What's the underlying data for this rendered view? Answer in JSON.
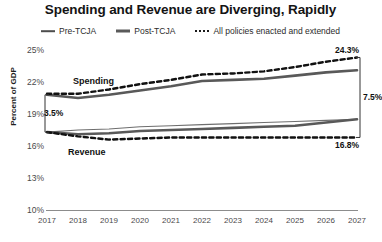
{
  "chart_data": {
    "type": "line",
    "title": "Spending and Revenue are Diverging, Rapidly",
    "xlabel": "",
    "ylabel": "Percent of GDP",
    "x": [
      2017,
      2018,
      2019,
      2020,
      2021,
      2022,
      2023,
      2024,
      2025,
      2026,
      2027
    ],
    "xtick_labels": [
      "2017",
      "2018",
      "2019",
      "2020",
      "2021",
      "2022",
      "2023",
      "2024",
      "2025",
      "2026",
      "2027"
    ],
    "ytick_labels": [
      "25%",
      "22%",
      "19%",
      "16%",
      "13%",
      "10%"
    ],
    "ytick_values": [
      25,
      22,
      19,
      16,
      13,
      10
    ],
    "ylim": [
      10,
      25
    ],
    "xlim": [
      2017,
      2027
    ],
    "grid": false,
    "legend_position": "top-center",
    "series": [
      {
        "name": "Pre-TCJA",
        "style": "solid-thin",
        "color": "#6e6e6e",
        "groups": [
          "spending",
          "revenue"
        ],
        "spending_values": [
          20.8,
          20.5,
          20.8,
          21.2,
          21.6,
          22.1,
          22.2,
          22.3,
          22.6,
          22.9,
          23.1
        ],
        "revenue_values": [
          17.3,
          17.5,
          17.6,
          17.8,
          17.9,
          18.0,
          18.1,
          18.2,
          18.3,
          18.4,
          18.5
        ]
      },
      {
        "name": "Post-TCJA",
        "style": "solid-thick",
        "color": "#595959",
        "groups": [
          "spending",
          "revenue"
        ],
        "spending_values": [
          20.8,
          20.5,
          20.8,
          21.2,
          21.6,
          22.1,
          22.2,
          22.3,
          22.6,
          22.9,
          23.1
        ],
        "revenue_values": [
          17.3,
          17.1,
          17.2,
          17.4,
          17.5,
          17.6,
          17.7,
          17.8,
          17.9,
          18.2,
          18.5
        ]
      },
      {
        "name": "All policies enacted and extended",
        "style": "dotted",
        "color": "#111111",
        "groups": [
          "spending",
          "revenue"
        ],
        "spending_values": [
          20.9,
          20.9,
          21.3,
          21.8,
          22.2,
          22.7,
          22.8,
          23.0,
          23.4,
          23.9,
          24.3
        ],
        "revenue_values": [
          17.3,
          16.9,
          16.6,
          16.7,
          16.8,
          16.8,
          16.8,
          16.8,
          16.8,
          16.8,
          16.8
        ]
      }
    ],
    "annotations": [
      {
        "id": "spending-label",
        "text": "Spending"
      },
      {
        "id": "revenue-label",
        "text": "Revenue"
      },
      {
        "id": "gap-left",
        "text": "3.5%"
      },
      {
        "id": "gap-right",
        "text": "7.5%"
      },
      {
        "id": "endpoint-top",
        "text": "24.3%"
      },
      {
        "id": "endpoint-bottom",
        "text": "16.8%"
      }
    ]
  },
  "chart": {
    "title": "Spending and Revenue are Diverging, Rapidly",
    "ylabel": "Percent of GDP",
    "legend": [
      {
        "label": "Pre-TCJA",
        "marker": "line-thin-icon"
      },
      {
        "label": "Post-TCJA",
        "marker": "line-thick-icon"
      },
      {
        "label": "All policies enacted and extended",
        "marker": "line-dotted-icon"
      }
    ],
    "yticks": [
      "25%",
      "22%",
      "19%",
      "16%",
      "13%",
      "10%"
    ],
    "xticks": [
      "2017",
      "2018",
      "2019",
      "2020",
      "2021",
      "2022",
      "2023",
      "2024",
      "2025",
      "2026",
      "2027"
    ],
    "annotations": {
      "spending": "Spending",
      "revenue": "Revenue",
      "gap_left": "3.5%",
      "gap_right": "7.5%",
      "endpoint_top": "24.3%",
      "endpoint_bottom": "16.8%"
    }
  }
}
